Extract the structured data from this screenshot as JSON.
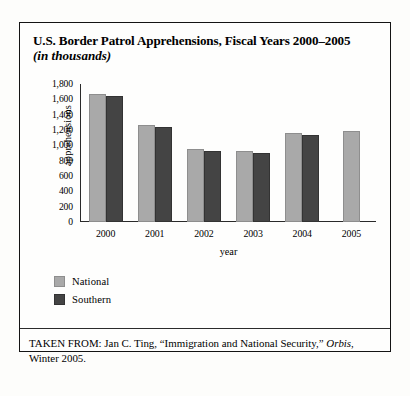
{
  "figure": {
    "title_line1": "U.S. Border Patrol Apprehensions, Fiscal Years 2000–2005",
    "title_line2": "(in thousands)"
  },
  "chart_data": {
    "type": "bar",
    "title": "U.S. Border Patrol Apprehensions, Fiscal Years 2000–2005 (in thousands)",
    "xlabel": "year",
    "ylabel": "apprehensions",
    "categories": [
      "2000",
      "2001",
      "2002",
      "2003",
      "2004",
      "2005"
    ],
    "series": [
      {
        "name": "National",
        "color": "#a9a9a9",
        "values": [
          1676,
          1266,
          955,
          932,
          1160,
          1189
        ]
      },
      {
        "name": "Southern",
        "color": "#444444",
        "values": [
          1643,
          1236,
          929,
          905,
          1139,
          null
        ]
      }
    ],
    "ylim": [
      0,
      1800
    ],
    "yticks": [
      1800,
      1600,
      1400,
      1200,
      1000,
      800,
      600,
      400,
      200,
      0
    ],
    "ytick_labels": [
      "1,800",
      "1,600",
      "1,400",
      "1,200",
      "1,000",
      "800",
      "600",
      "400",
      "200",
      "0"
    ],
    "grid": false,
    "legend_position": "below-left"
  },
  "legend": {
    "items": [
      {
        "label": "National"
      },
      {
        "label": "Southern"
      }
    ]
  },
  "source": {
    "prefix": "TAKEN FROM: Jan C. Ting, “Immigration and National Security,”",
    "italic": "Orbis",
    "suffix": ", Winter 2005."
  }
}
